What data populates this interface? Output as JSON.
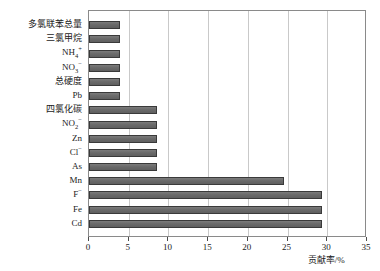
{
  "chart_data": {
    "type": "bar",
    "orientation": "horizontal",
    "title": "",
    "xlabel": "贡献率/%",
    "ylabel": "",
    "xlim": [
      0,
      35
    ],
    "xticks": [
      0,
      5,
      10,
      15,
      20,
      25,
      30,
      35
    ],
    "grid": "vertical",
    "legend": "none",
    "bar_color": "#6e6e6e",
    "bar_edge_color": "#3a3a3a",
    "categories": [
      "多氯联苯总量",
      "三氯甲烷",
      "NH4+",
      "NO3-",
      "总硬度",
      "Pb",
      "四氯化碳",
      "NO2-",
      "Zn",
      "Cl-",
      "As",
      "Mn",
      "F-",
      "Fe",
      "Cd"
    ],
    "values": [
      3.9,
      3.9,
      3.9,
      3.9,
      3.9,
      3.9,
      8.5,
      8.5,
      8.5,
      8.5,
      8.5,
      24.5,
      29.3,
      29.3,
      29.3
    ],
    "bars": [
      {
        "label_main": "多氯联苯总量",
        "sup": "",
        "sub": "",
        "value": 3.9
      },
      {
        "label_main": "三氯甲烷",
        "sup": "",
        "sub": "",
        "value": 3.9
      },
      {
        "label_main": "NH",
        "sup": "+",
        "sub": "4",
        "value": 3.9
      },
      {
        "label_main": "NO",
        "sup": "−",
        "sub": "3",
        "value": 3.9
      },
      {
        "label_main": "总硬度",
        "sup": "",
        "sub": "",
        "value": 3.9
      },
      {
        "label_main": "Pb",
        "sup": "",
        "sub": "",
        "value": 3.9
      },
      {
        "label_main": "四氯化碳",
        "sup": "",
        "sub": "",
        "value": 8.5
      },
      {
        "label_main": "NO",
        "sup": "−",
        "sub": "2",
        "value": 8.5
      },
      {
        "label_main": "Zn",
        "sup": "",
        "sub": "",
        "value": 8.5
      },
      {
        "label_main": "Cl",
        "sup": "−",
        "sub": "",
        "value": 8.5
      },
      {
        "label_main": "As",
        "sup": "",
        "sub": "",
        "value": 8.5
      },
      {
        "label_main": "Mn",
        "sup": "",
        "sub": "",
        "value": 24.5
      },
      {
        "label_main": "F",
        "sup": "−",
        "sub": "",
        "value": 29.3
      },
      {
        "label_main": "Fe",
        "sup": "",
        "sub": "",
        "value": 29.3
      },
      {
        "label_main": "Cd",
        "sup": "",
        "sub": "",
        "value": 29.3
      }
    ]
  }
}
